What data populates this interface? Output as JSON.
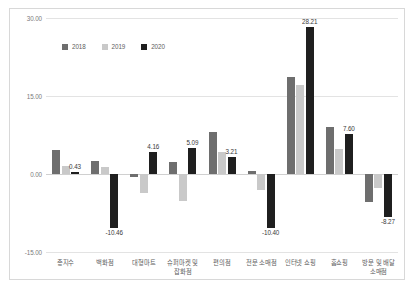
{
  "chart_data": {
    "type": "bar",
    "title": "",
    "subtitle": "",
    "xlabel": "",
    "ylabel": "",
    "ylim": [
      -15.0,
      30.0
    ],
    "yticks": [
      "30.00",
      "15.00",
      "0.00",
      "-15.00"
    ],
    "ytick_values": [
      30.0,
      15.0,
      0.0,
      -15.0
    ],
    "grid": true,
    "legend_position": "top-left",
    "categories": [
      "총지수",
      "백화점",
      "대형마트",
      "슈퍼마켓 및\n잡화점",
      "편의점",
      "전문 소매점",
      "인터넷 쇼핑",
      "홈쇼핑",
      "방문 및 배달\n소매점"
    ],
    "series": [
      {
        "name": "2018",
        "color": "#6e6e6e",
        "values": [
          4.53,
          2.41,
          -0.65,
          2.31,
          8.09,
          0.53,
          18.66,
          9.01,
          -5.33
        ]
      },
      {
        "name": "2019",
        "color": "#c9c9c9",
        "values": [
          1.45,
          1.42,
          -3.72,
          -5.21,
          4.26,
          -3.12,
          17.12,
          4.85,
          -2.71
        ]
      },
      {
        "name": "2020",
        "color": "#1f1f1f",
        "values": [
          0.43,
          -10.46,
          4.16,
          5.09,
          3.21,
          -10.4,
          28.21,
          7.6,
          -8.27
        ]
      }
    ],
    "data_labels": [
      {
        "category": "총지수",
        "series": "2020",
        "text": "0.43",
        "value": 0.43
      },
      {
        "category": "백화점",
        "series": "2020",
        "text": "-10.46",
        "value": -10.46
      },
      {
        "category": "대형마트",
        "series": "2020",
        "text": "4.16",
        "value": 4.16
      },
      {
        "category": "슈퍼마켓 및 잡화점",
        "series": "2020",
        "text": "5.09",
        "value": 5.09
      },
      {
        "category": "편의점",
        "series": "2020",
        "text": "3.21",
        "value": 3.21
      },
      {
        "category": "전문 소매점",
        "series": "2020",
        "text": "-10.40",
        "value": -10.4
      },
      {
        "category": "인터넷 쇼핑",
        "series": "2020",
        "text": "28.21",
        "value": 28.21
      },
      {
        "category": "홈쇼핑",
        "series": "2020",
        "text": "7.60",
        "value": 7.6
      },
      {
        "category": "방문 및 배달 소매점",
        "series": "2020",
        "text": "-8.27",
        "value": -8.27
      }
    ]
  },
  "legend": {
    "items": [
      {
        "label": "2018",
        "color": "#6e6e6e"
      },
      {
        "label": "2019",
        "color": "#c9c9c9"
      },
      {
        "label": "2020",
        "color": "#1f1f1f"
      }
    ]
  }
}
